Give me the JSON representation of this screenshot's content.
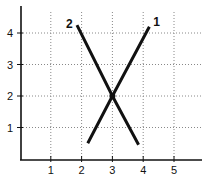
{
  "chart_data": {
    "type": "line",
    "title": "",
    "xlabel": "",
    "ylabel": "",
    "xlim": [
      0,
      5.8
    ],
    "ylim": [
      0,
      4.6
    ],
    "xticks": [
      1,
      2,
      3,
      4,
      5
    ],
    "yticks": [
      1,
      2,
      3,
      4
    ],
    "xtick_labels": [
      "1",
      "2",
      "3",
      "4",
      "5"
    ],
    "ytick_labels": [
      "1",
      "2",
      "3",
      "4"
    ],
    "grid": "dotted",
    "legend": "none (lines labelled at their upper ends)",
    "series": [
      {
        "name": "1",
        "points": [
          [
            2.2,
            0.5
          ],
          [
            3,
            2
          ],
          [
            4.2,
            4.2
          ]
        ]
      },
      {
        "name": "2",
        "points": [
          [
            1.85,
            4.25
          ],
          [
            3,
            2
          ],
          [
            3.85,
            0.45
          ]
        ]
      }
    ],
    "annotations": [
      {
        "text": "intersection",
        "x": 3,
        "y": 2
      }
    ],
    "colors": {
      "line": "#111111",
      "grid": "#888888",
      "axis": "#111111"
    }
  }
}
